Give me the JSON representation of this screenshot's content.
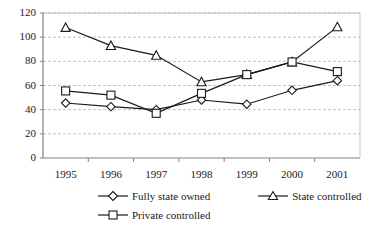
{
  "chart_data": {
    "type": "line",
    "title": "",
    "xlabel": "",
    "ylabel": "",
    "categories": [
      "1995",
      "1996",
      "1997",
      "1998",
      "1999",
      "2000",
      "2001"
    ],
    "ylim": [
      0,
      120
    ],
    "yticks": [
      0,
      20,
      40,
      60,
      80,
      100,
      120
    ],
    "grid": true,
    "grid_style": "dashed-horizontal",
    "legend_position": "bottom",
    "series": [
      {
        "name": "Fully state owned",
        "marker": "diamond",
        "values": [
          45.5,
          42.5,
          40.0,
          48.0,
          44.5,
          56.0,
          64.0
        ]
      },
      {
        "name": "State controlled",
        "marker": "triangle",
        "values": [
          108.0,
          93.0,
          85.0,
          63.0,
          69.0,
          79.5,
          108.5
        ]
      },
      {
        "name": "Private controlled",
        "marker": "square",
        "values": [
          55.5,
          52.0,
          37.0,
          53.5,
          69.0,
          79.5,
          71.5
        ]
      }
    ]
  },
  "axis": {
    "ytick_labels": [
      "120",
      "100",
      "80",
      "60",
      "40",
      "20",
      "0"
    ],
    "xtick_labels": [
      "1995",
      "1996",
      "1997",
      "1998",
      "1999",
      "2000",
      "2001"
    ]
  },
  "legend": {
    "items": [
      {
        "label": "Fully state owned",
        "marker": "diamond-marker-icon"
      },
      {
        "label": "State controlled",
        "marker": "triangle-marker-icon"
      },
      {
        "label": "Private controlled",
        "marker": "square-marker-icon"
      }
    ]
  },
  "colors": {
    "line": "#1a1a1a",
    "grid": "#b4b4b4",
    "axis": "#808080",
    "marker_fill": "#ffffff",
    "background": "#ffffff"
  }
}
